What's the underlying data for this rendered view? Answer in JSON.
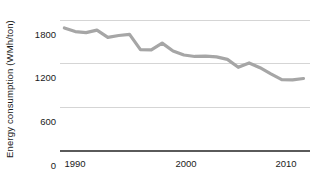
{
  "chart_data": {
    "type": "line",
    "title": "",
    "xlabel": "",
    "ylabel": "Energy consumption (WMh/ton)",
    "xlim": [
      1988.6,
      2011.6
    ],
    "ylim": [
      0,
      1800
    ],
    "grid": true,
    "legend": null,
    "ytick_labels": [
      "1800",
      "1200",
      "600",
      "0"
    ],
    "yticks": [
      1800,
      1200,
      600,
      0
    ],
    "xtick_labels": [
      "1990",
      "2000",
      "2010"
    ],
    "xticks": [
      1990,
      2000,
      2010
    ],
    "series": [
      {
        "name": "Energy consumption",
        "color": "#a6a6a6",
        "x": [
          1989,
          1990,
          1991,
          1992,
          1993,
          1994,
          1995,
          1996,
          1997,
          1998,
          1999,
          2000,
          2001,
          2002,
          2003,
          2004,
          2005,
          2006,
          2007,
          2008,
          2009,
          2010,
          2011
        ],
        "values": [
          1690,
          1640,
          1625,
          1660,
          1560,
          1585,
          1600,
          1390,
          1385,
          1480,
          1370,
          1315,
          1295,
          1300,
          1290,
          1255,
          1145,
          1205,
          1140,
          1055,
          975,
          970,
          990
        ]
      }
    ]
  },
  "axis": {
    "y_title": "Energy consumption (WMh/ton)",
    "y_labels": [
      "1800",
      "1200",
      "600",
      "0"
    ],
    "x_labels": [
      "1990",
      "2000",
      "2010"
    ]
  },
  "colors": {
    "series_line": "#a6a6a6",
    "gridline": "#d5d5d5",
    "axis": "#5a5a5a",
    "text": "#1a1a1a",
    "background": "#ffffff"
  }
}
